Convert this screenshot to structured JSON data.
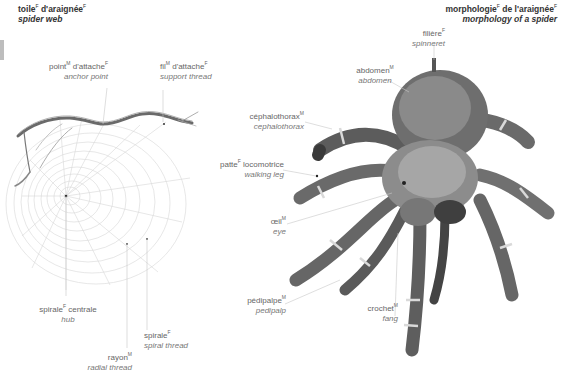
{
  "left_panel": {
    "title": {
      "fr": "toile",
      "fr_gender": "F",
      "fr2": "d'araignée",
      "fr2_gender": "F",
      "en": "spider web"
    },
    "labels": [
      {
        "id": "anchor-point",
        "fr": "point",
        "g1": "M",
        "fr_rest": "d'attache",
        "g2": "F",
        "en": "anchor point"
      },
      {
        "id": "support-thread",
        "fr": "fil",
        "g1": "M",
        "fr_rest": "d'attache",
        "g2": "F",
        "en": "support thread"
      },
      {
        "id": "hub",
        "fr": "spirale",
        "g1": "F",
        "fr_rest": "centrale",
        "g2": "",
        "en": "hub"
      },
      {
        "id": "radial-thread",
        "fr": "rayon",
        "g1": "M",
        "fr_rest": "",
        "g2": "",
        "en": "radial thread"
      },
      {
        "id": "spiral-thread",
        "fr": "spirale",
        "g1": "F",
        "fr_rest": "",
        "g2": "",
        "en": "spiral thread"
      }
    ]
  },
  "right_panel": {
    "title": {
      "fr": "morphologie",
      "fr_gender": "F",
      "fr2": "de l'araignée",
      "fr2_gender": "F",
      "en": "morphology of a spider"
    },
    "labels": [
      {
        "id": "spinneret",
        "fr": "filière",
        "g1": "F",
        "en": "spinneret"
      },
      {
        "id": "abdomen",
        "fr": "abdomen",
        "g1": "M",
        "en": "abdomen"
      },
      {
        "id": "cephalothorax",
        "fr": "céphalothorax",
        "g1": "M",
        "en": "cephalothorax"
      },
      {
        "id": "walking-leg",
        "fr": "patte",
        "g1": "F",
        "fr_rest": "locomotrice",
        "en": "walking leg"
      },
      {
        "id": "eye",
        "fr": "œil",
        "g1": "M",
        "en": "eye"
      },
      {
        "id": "pedipalp",
        "fr": "pédipalpe",
        "g1": "M",
        "en": "pedipalp"
      },
      {
        "id": "fang",
        "fr": "crochet",
        "g1": "M",
        "en": "fang"
      }
    ]
  },
  "colors": {
    "text": "#666666",
    "title": "#333333",
    "leader": "#c8c8c8",
    "tab": "#bdbdbd",
    "web": "#d4d4d4"
  }
}
